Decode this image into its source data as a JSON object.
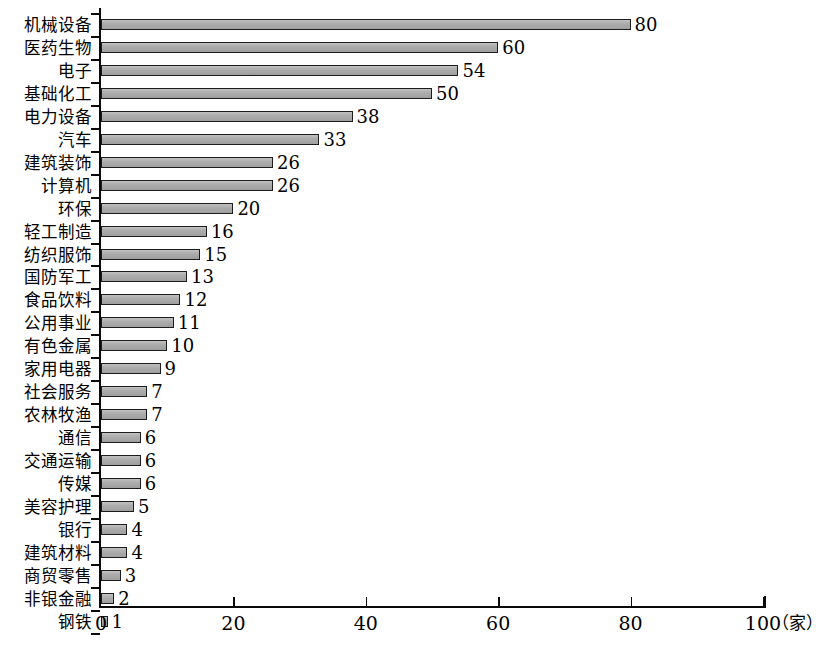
{
  "chart_data": {
    "type": "bar",
    "orientation": "horizontal",
    "title": "",
    "xlabel": "",
    "ylabel": "",
    "unit_label": "（家）",
    "xlim": [
      0,
      100
    ],
    "xticks": [
      0,
      20,
      40,
      60,
      80,
      100
    ],
    "xtick_labels": [
      "0",
      "20",
      "40",
      "60",
      "80",
      "100"
    ],
    "grid": false,
    "legend": false,
    "bar_color": "#a9a9a9",
    "bar_edge_color": "#1c1c1c",
    "axis_color": "#0a0a0a",
    "categories": [
      "机械设备",
      "医药生物",
      "电子",
      "基础化工",
      "电力设备",
      "汽车",
      "建筑装饰",
      "计算机",
      "环保",
      "轻工制造",
      "纺织服饰",
      "国防军工",
      "食品饮料",
      "公用事业",
      "有色金属",
      "家用电器",
      "社会服务",
      "农林牧渔",
      "通信",
      "交通运输",
      "传媒",
      "美容护理",
      "银行",
      "建筑材料",
      "商贸零售",
      "非银金融",
      "钢铁"
    ],
    "values": [
      80,
      60,
      54,
      50,
      38,
      33,
      26,
      26,
      20,
      16,
      15,
      13,
      12,
      11,
      10,
      9,
      7,
      7,
      6,
      6,
      6,
      5,
      4,
      4,
      3,
      2,
      1
    ],
    "value_labels": [
      "80",
      "60",
      "54",
      "50",
      "38",
      "33",
      "26",
      "26",
      "20",
      "16",
      "15",
      "13",
      "12",
      "11",
      "10",
      "9",
      "7",
      "7",
      "6",
      "6",
      "6",
      "5",
      "4",
      "4",
      "3",
      "2",
      "1"
    ]
  }
}
